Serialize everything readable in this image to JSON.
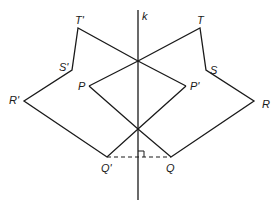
{
  "diagram": {
    "type": "reflection",
    "line_of_reflection": {
      "label": "k",
      "x": 138,
      "y1": 10,
      "y2": 200
    },
    "colors": {
      "stroke": "#1a1a1a",
      "background": "#ffffff"
    },
    "points": {
      "T": {
        "label": "T",
        "x": 200,
        "y": 28
      },
      "S": {
        "label": "S",
        "x": 206,
        "y": 70
      },
      "R": {
        "label": "R",
        "x": 254,
        "y": 101
      },
      "Q": {
        "label": "Q",
        "x": 171,
        "y": 157
      },
      "P": {
        "label": "P",
        "x": 89,
        "y": 86
      },
      "T_prime": {
        "label": "T'",
        "x": 78,
        "y": 28
      },
      "S_prime": {
        "label": "S'",
        "x": 72,
        "y": 70
      },
      "R_prime": {
        "label": "R'",
        "x": 24,
        "y": 101
      },
      "Q_prime": {
        "label": "Q'",
        "x": 107,
        "y": 157
      },
      "P_prime": {
        "label": "P'",
        "x": 186,
        "y": 86
      }
    },
    "original_figure": [
      "P",
      "T",
      "S",
      "R",
      "Q"
    ],
    "image_figure": [
      "P'",
      "T'",
      "S'",
      "R'",
      "Q'"
    ],
    "dashed_segment": {
      "from": "Q'",
      "to": "Q"
    },
    "right_angle_marker": {
      "at": "intersection of QQ' and k"
    }
  }
}
